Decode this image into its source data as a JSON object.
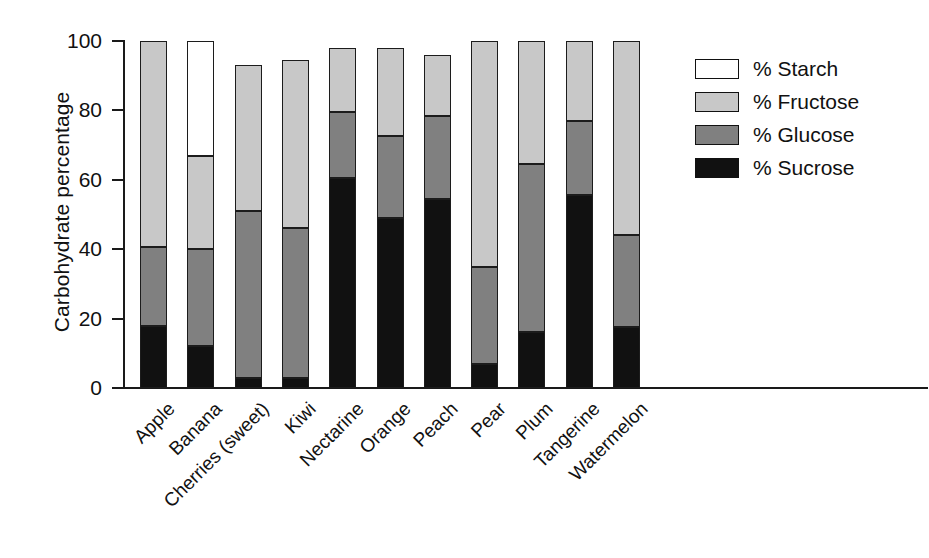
{
  "chart_data": {
    "type": "bar",
    "subtype": "stacked-bar",
    "title": "",
    "xlabel": "",
    "ylabel": "Carbohydrate percentage",
    "ylim": [
      0,
      100
    ],
    "yticks": [
      0,
      20,
      40,
      60,
      80,
      100
    ],
    "grid": false,
    "legend_position": "right",
    "categories": [
      "Apple",
      "Banana",
      "Cherries (sweet)",
      "Kiwi",
      "Nectarine",
      "Orange",
      "Peach",
      "Pear",
      "Plum",
      "Tangerine",
      "Watermelon"
    ],
    "series": [
      {
        "name": "% Sucrose",
        "color": "#111111",
        "values": [
          18,
          12,
          3,
          3,
          60.5,
          49,
          54.5,
          7,
          16,
          55.5,
          17.5
        ]
      },
      {
        "name": "% Glucose",
        "color": "#808080",
        "values": [
          22.5,
          28,
          48,
          43,
          19,
          23.5,
          24,
          28,
          48.5,
          21.5,
          26.5
        ]
      },
      {
        "name": "% Fructose",
        "color": "#c8c8c8",
        "values": [
          59.5,
          27,
          42,
          48.5,
          18.5,
          25.5,
          17.5,
          65,
          35.5,
          23,
          56
        ]
      },
      {
        "name": "% Starch",
        "color": "#ffffff",
        "values": [
          0,
          33,
          0,
          0,
          0,
          0,
          0,
          0,
          0,
          0,
          0
        ]
      }
    ],
    "stack_totals": [
      100,
      100,
      93,
      94.5,
      98,
      98,
      96,
      100,
      100,
      100,
      100
    ]
  },
  "axis": {
    "y_title": "Carbohydrate percentage",
    "y_ticks": [
      "100",
      "80",
      "60",
      "40",
      "20",
      "0"
    ]
  },
  "legend": {
    "items": [
      {
        "label": "% Starch",
        "swatch": "starch"
      },
      {
        "label": "% Fructose",
        "swatch": "fructose"
      },
      {
        "label": "% Glucose",
        "swatch": "glucose"
      },
      {
        "label": "% Sucrose",
        "swatch": "sucrose"
      }
    ]
  }
}
